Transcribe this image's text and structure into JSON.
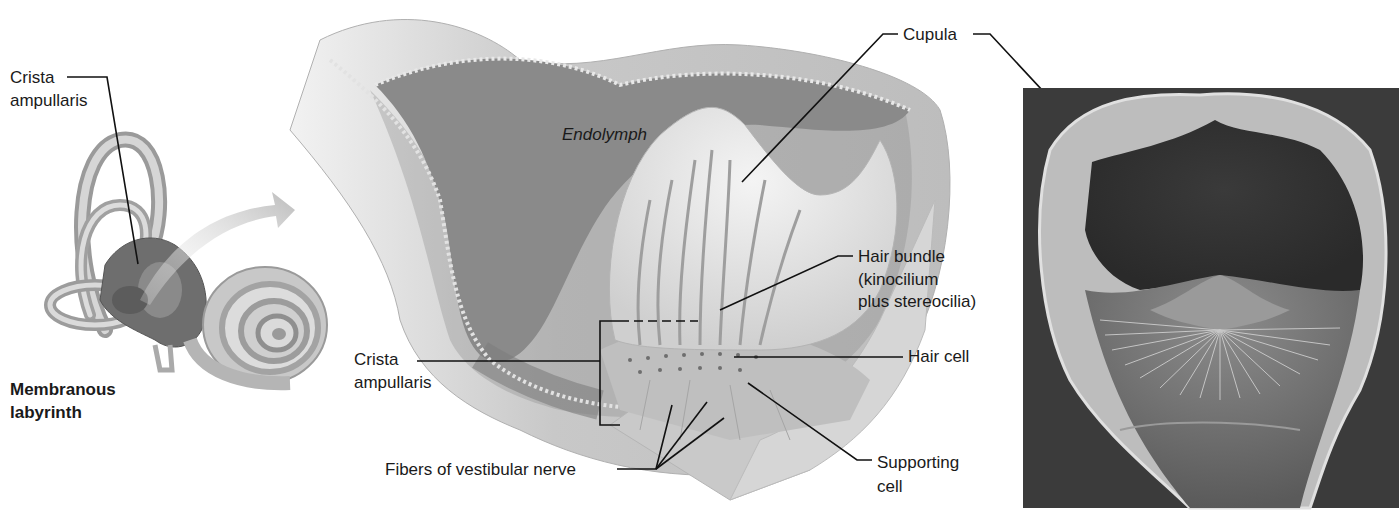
{
  "figure": {
    "panels": [
      {
        "id": "membranous-labyrinth",
        "title": "Membranous labyrinth"
      },
      {
        "id": "ampulla-cutaway",
        "title": ""
      },
      {
        "id": "sem-micrograph",
        "title": ""
      }
    ],
    "labels": {
      "crista_left_line1": "Crista",
      "crista_left_line2": "ampullaris",
      "labyrinth_line1": "Membranous",
      "labyrinth_line2": "labyrinth",
      "endolymph": "Endolymph",
      "cupula": "Cupula",
      "hair_bundle_line1": "Hair bundle",
      "hair_bundle_line2": "(kinocilium",
      "hair_bundle_line3": "plus stereocilia)",
      "hair_cell": "Hair cell",
      "crista_mid_line1": "Crista",
      "crista_mid_line2": "ampullaris",
      "fibers": "Fibers of vestibular nerve",
      "supporting_line1": "Supporting",
      "supporting_line2": "cell"
    }
  }
}
